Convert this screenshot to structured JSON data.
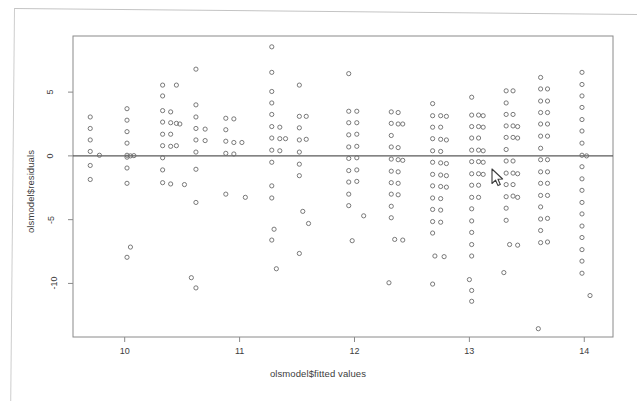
{
  "figure": {
    "kind": "r-base-scatter-plot",
    "background_color": "#ffffff",
    "frame_color": "#8a8a8a",
    "point_color": "#6b6b6b",
    "text_color": "#3c3c3c",
    "abline_color": "#5a5a5a"
  },
  "cursor": {
    "name": "mouse-pointer",
    "x": 495,
    "y": 176
  },
  "chart_data": {
    "type": "scatter",
    "title": "",
    "subtitle": "",
    "xlabel": "olsmodel$fitted values",
    "ylabel": "olsmodel$residuals",
    "xlim": [
      9.55,
      14.25
    ],
    "ylim": [
      -14.2,
      9.4
    ],
    "xticks": [
      10,
      11,
      12,
      13,
      14
    ],
    "yticks": [
      5,
      0,
      -5,
      -10
    ],
    "xtick_labels": [
      "10",
      "11",
      "12",
      "13",
      "14"
    ],
    "ytick_labels": [
      "5",
      "0",
      "-5",
      "-10"
    ],
    "grid": false,
    "legend": null,
    "annotations": [],
    "reference_line": {
      "type": "horizontal",
      "y": 0,
      "label": ""
    },
    "marker": {
      "shape": "open-circle",
      "radius_px": 2.1,
      "stroke_px": 0.9
    },
    "n_points": 268,
    "points": [
      [
        9.7,
        3.05
      ],
      [
        9.7,
        2.15
      ],
      [
        9.7,
        1.25
      ],
      [
        9.7,
        0.35
      ],
      [
        9.7,
        -0.75
      ],
      [
        9.7,
        -1.85
      ],
      [
        9.78,
        0.05
      ],
      [
        10.02,
        3.7
      ],
      [
        10.02,
        2.8
      ],
      [
        10.02,
        1.9
      ],
      [
        10.02,
        1.0
      ],
      [
        10.02,
        0.05
      ],
      [
        10.02,
        -0.1
      ],
      [
        10.02,
        -0.95
      ],
      [
        10.02,
        -2.15
      ],
      [
        10.05,
        0.0
      ],
      [
        10.08,
        0.02
      ],
      [
        10.05,
        -7.15
      ],
      [
        10.02,
        -7.95
      ],
      [
        10.33,
        5.55
      ],
      [
        10.33,
        4.7
      ],
      [
        10.33,
        3.55
      ],
      [
        10.33,
        2.65
      ],
      [
        10.33,
        1.7
      ],
      [
        10.33,
        0.8
      ],
      [
        10.33,
        -0.15
      ],
      [
        10.33,
        -1.1
      ],
      [
        10.33,
        -2.1
      ],
      [
        10.4,
        3.45
      ],
      [
        10.4,
        2.6
      ],
      [
        10.4,
        1.7
      ],
      [
        10.4,
        0.75
      ],
      [
        10.4,
        -2.2
      ],
      [
        10.45,
        5.55
      ],
      [
        10.45,
        2.55
      ],
      [
        10.45,
        0.8
      ],
      [
        10.48,
        2.5
      ],
      [
        10.52,
        -2.25
      ],
      [
        10.62,
        6.8
      ],
      [
        10.62,
        4.0
      ],
      [
        10.62,
        3.05
      ],
      [
        10.62,
        2.15
      ],
      [
        10.62,
        1.25
      ],
      [
        10.62,
        0.3
      ],
      [
        10.62,
        -1.05
      ],
      [
        10.62,
        -3.65
      ],
      [
        10.7,
        2.1
      ],
      [
        10.7,
        1.2
      ],
      [
        10.58,
        -9.55
      ],
      [
        10.62,
        -10.35
      ],
      [
        10.88,
        2.95
      ],
      [
        10.88,
        2.05
      ],
      [
        10.88,
        1.15
      ],
      [
        10.88,
        0.2
      ],
      [
        10.88,
        -3.0
      ],
      [
        10.95,
        2.9
      ],
      [
        10.95,
        1.05
      ],
      [
        10.95,
        0.15
      ],
      [
        11.02,
        1.05
      ],
      [
        11.05,
        -3.25
      ],
      [
        11.28,
        8.55
      ],
      [
        11.28,
        6.55
      ],
      [
        11.28,
        5.05
      ],
      [
        11.28,
        4.15
      ],
      [
        11.28,
        3.25
      ],
      [
        11.28,
        2.3
      ],
      [
        11.28,
        1.4
      ],
      [
        11.28,
        0.45
      ],
      [
        11.28,
        -0.5
      ],
      [
        11.28,
        -2.35
      ],
      [
        11.28,
        -3.3
      ],
      [
        11.35,
        2.25
      ],
      [
        11.35,
        1.35
      ],
      [
        11.35,
        0.4
      ],
      [
        11.4,
        1.35
      ],
      [
        11.3,
        -5.75
      ],
      [
        11.28,
        -6.6
      ],
      [
        11.32,
        -8.85
      ],
      [
        11.52,
        5.55
      ],
      [
        11.52,
        3.1
      ],
      [
        11.52,
        2.2
      ],
      [
        11.52,
        1.25
      ],
      [
        11.52,
        0.3
      ],
      [
        11.52,
        -0.65
      ],
      [
        11.52,
        -1.55
      ],
      [
        11.58,
        3.1
      ],
      [
        11.58,
        1.3
      ],
      [
        11.55,
        -4.35
      ],
      [
        11.6,
        -5.3
      ],
      [
        11.52,
        -7.65
      ],
      [
        11.95,
        6.45
      ],
      [
        11.95,
        3.5
      ],
      [
        11.95,
        2.6
      ],
      [
        11.95,
        1.65
      ],
      [
        11.95,
        0.7
      ],
      [
        11.95,
        -0.2
      ],
      [
        11.95,
        -1.15
      ],
      [
        11.95,
        -2.05
      ],
      [
        11.95,
        -3.0
      ],
      [
        11.95,
        -3.9
      ],
      [
        12.02,
        3.5
      ],
      [
        12.02,
        2.6
      ],
      [
        12.02,
        1.7
      ],
      [
        12.02,
        0.75
      ],
      [
        12.02,
        -0.15
      ],
      [
        12.02,
        -1.1
      ],
      [
        12.02,
        -2.0
      ],
      [
        12.08,
        -4.7
      ],
      [
        11.98,
        -6.65
      ],
      [
        12.32,
        3.45
      ],
      [
        12.32,
        2.55
      ],
      [
        12.32,
        1.6
      ],
      [
        12.32,
        0.7
      ],
      [
        12.32,
        -0.25
      ],
      [
        12.32,
        -1.2
      ],
      [
        12.32,
        -2.1
      ],
      [
        12.32,
        -3.0
      ],
      [
        12.32,
        -3.95
      ],
      [
        12.32,
        -4.85
      ],
      [
        12.38,
        3.4
      ],
      [
        12.38,
        2.5
      ],
      [
        12.38,
        0.65
      ],
      [
        12.38,
        -0.3
      ],
      [
        12.38,
        -1.25
      ],
      [
        12.38,
        -2.15
      ],
      [
        12.38,
        -3.05
      ],
      [
        12.42,
        2.5
      ],
      [
        12.42,
        -0.35
      ],
      [
        12.35,
        -6.55
      ],
      [
        12.42,
        -6.6
      ],
      [
        12.3,
        -9.95
      ],
      [
        12.68,
        4.1
      ],
      [
        12.68,
        3.15
      ],
      [
        12.68,
        2.25
      ],
      [
        12.68,
        1.35
      ],
      [
        12.68,
        0.4
      ],
      [
        12.68,
        -0.5
      ],
      [
        12.68,
        -1.45
      ],
      [
        12.68,
        -2.35
      ],
      [
        12.68,
        -3.3
      ],
      [
        12.68,
        -4.2
      ],
      [
        12.68,
        -5.15
      ],
      [
        12.68,
        -6.05
      ],
      [
        12.75,
        3.15
      ],
      [
        12.75,
        2.25
      ],
      [
        12.75,
        1.3
      ],
      [
        12.75,
        0.35
      ],
      [
        12.75,
        -0.55
      ],
      [
        12.75,
        -1.5
      ],
      [
        12.75,
        -2.4
      ],
      [
        12.75,
        -3.35
      ],
      [
        12.75,
        -4.25
      ],
      [
        12.75,
        -5.2
      ],
      [
        12.8,
        3.1
      ],
      [
        12.8,
        1.25
      ],
      [
        12.8,
        -0.6
      ],
      [
        12.8,
        -1.55
      ],
      [
        12.8,
        -2.45
      ],
      [
        12.7,
        -7.85
      ],
      [
        12.78,
        -7.9
      ],
      [
        12.68,
        -10.05
      ],
      [
        13.02,
        4.6
      ],
      [
        13.02,
        3.2
      ],
      [
        13.02,
        2.3
      ],
      [
        13.02,
        1.4
      ],
      [
        13.02,
        0.45
      ],
      [
        13.02,
        -0.45
      ],
      [
        13.02,
        -1.4
      ],
      [
        13.02,
        -2.3
      ],
      [
        13.02,
        -3.25
      ],
      [
        13.02,
        -4.15
      ],
      [
        13.02,
        -5.1
      ],
      [
        13.02,
        -6.0
      ],
      [
        13.02,
        -6.95
      ],
      [
        13.02,
        -7.85
      ],
      [
        13.08,
        3.2
      ],
      [
        13.08,
        2.3
      ],
      [
        13.08,
        1.4
      ],
      [
        13.08,
        0.45
      ],
      [
        13.08,
        -0.45
      ],
      [
        13.08,
        -1.4
      ],
      [
        13.08,
        -2.3
      ],
      [
        13.08,
        -3.25
      ],
      [
        13.12,
        3.15
      ],
      [
        13.12,
        2.25
      ],
      [
        13.12,
        0.4
      ],
      [
        13.12,
        -0.5
      ],
      [
        13.12,
        -1.45
      ],
      [
        13.0,
        -9.7
      ],
      [
        13.02,
        -10.55
      ],
      [
        13.02,
        -11.4
      ],
      [
        13.32,
        5.1
      ],
      [
        13.32,
        4.15
      ],
      [
        13.32,
        3.25
      ],
      [
        13.32,
        2.35
      ],
      [
        13.32,
        1.45
      ],
      [
        13.32,
        0.5
      ],
      [
        13.32,
        -0.4
      ],
      [
        13.32,
        -1.35
      ],
      [
        13.32,
        -2.25
      ],
      [
        13.32,
        -3.2
      ],
      [
        13.32,
        -4.1
      ],
      [
        13.32,
        -5.05
      ],
      [
        13.38,
        5.1
      ],
      [
        13.38,
        3.25
      ],
      [
        13.38,
        2.35
      ],
      [
        13.38,
        1.45
      ],
      [
        13.38,
        -0.4
      ],
      [
        13.38,
        -1.35
      ],
      [
        13.38,
        -2.25
      ],
      [
        13.38,
        -3.15
      ],
      [
        13.42,
        2.3
      ],
      [
        13.42,
        1.4
      ],
      [
        13.42,
        -1.4
      ],
      [
        13.42,
        -3.25
      ],
      [
        13.35,
        -6.95
      ],
      [
        13.42,
        -7.0
      ],
      [
        13.3,
        -9.15
      ],
      [
        13.62,
        6.15
      ],
      [
        13.62,
        5.25
      ],
      [
        13.62,
        4.3
      ],
      [
        13.62,
        3.4
      ],
      [
        13.62,
        2.5
      ],
      [
        13.62,
        1.55
      ],
      [
        13.62,
        0.6
      ],
      [
        13.62,
        -0.3
      ],
      [
        13.62,
        -1.25
      ],
      [
        13.62,
        -2.15
      ],
      [
        13.62,
        -3.1
      ],
      [
        13.62,
        -4.0
      ],
      [
        13.62,
        -4.95
      ],
      [
        13.62,
        -5.85
      ],
      [
        13.62,
        -6.8
      ],
      [
        13.68,
        5.25
      ],
      [
        13.68,
        4.3
      ],
      [
        13.68,
        3.4
      ],
      [
        13.68,
        2.5
      ],
      [
        13.68,
        1.55
      ],
      [
        13.68,
        -0.3
      ],
      [
        13.68,
        -1.25
      ],
      [
        13.68,
        -2.15
      ],
      [
        13.68,
        -3.1
      ],
      [
        13.68,
        -4.9
      ],
      [
        13.68,
        -6.75
      ],
      [
        13.6,
        -13.55
      ],
      [
        13.98,
        6.55
      ],
      [
        13.98,
        5.6
      ],
      [
        13.98,
        4.7
      ],
      [
        13.98,
        3.8
      ],
      [
        13.98,
        2.85
      ],
      [
        13.98,
        1.95
      ],
      [
        13.98,
        1.0
      ],
      [
        13.98,
        0.05
      ],
      [
        13.98,
        -0.85
      ],
      [
        13.98,
        -1.8
      ],
      [
        13.98,
        -2.7
      ],
      [
        13.98,
        -3.65
      ],
      [
        13.98,
        -4.55
      ],
      [
        13.98,
        -5.5
      ],
      [
        13.98,
        -6.4
      ],
      [
        13.98,
        -7.35
      ],
      [
        13.98,
        -8.25
      ],
      [
        13.98,
        -9.2
      ],
      [
        14.02,
        0.0
      ],
      [
        14.05,
        -10.95
      ]
    ]
  }
}
